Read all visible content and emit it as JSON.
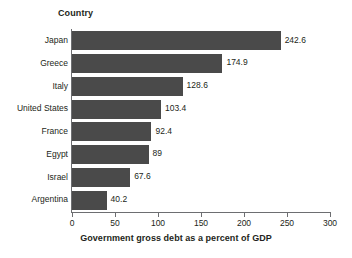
{
  "chart_data": {
    "type": "bar",
    "orientation": "horizontal",
    "title": "",
    "category_axis_title": "Country",
    "xlabel": "Government gross debt as a percent of GDP",
    "ylabel": "Country",
    "categories": [
      "Japan",
      "Greece",
      "Italy",
      "United States",
      "France",
      "Egypt",
      "Israel",
      "Argentina"
    ],
    "values": [
      242.6,
      174.9,
      128.6,
      103.4,
      92.4,
      89,
      67.6,
      40.2
    ],
    "value_labels": [
      "242.6",
      "174.9",
      "128.6",
      "103.4",
      "92.4",
      "89",
      "67.6",
      "40.2"
    ],
    "xlim": [
      0,
      300
    ],
    "xticks": [
      0,
      50,
      100,
      150,
      200,
      250,
      300
    ],
    "xtick_labels": [
      "0",
      "50",
      "100",
      "150",
      "200",
      "250",
      "300"
    ],
    "grid": false,
    "legend": false,
    "bar_color": "#4a4a4a",
    "axis_color": "#6d6e71",
    "text_color": "#231f20",
    "background": "#ffffff"
  }
}
